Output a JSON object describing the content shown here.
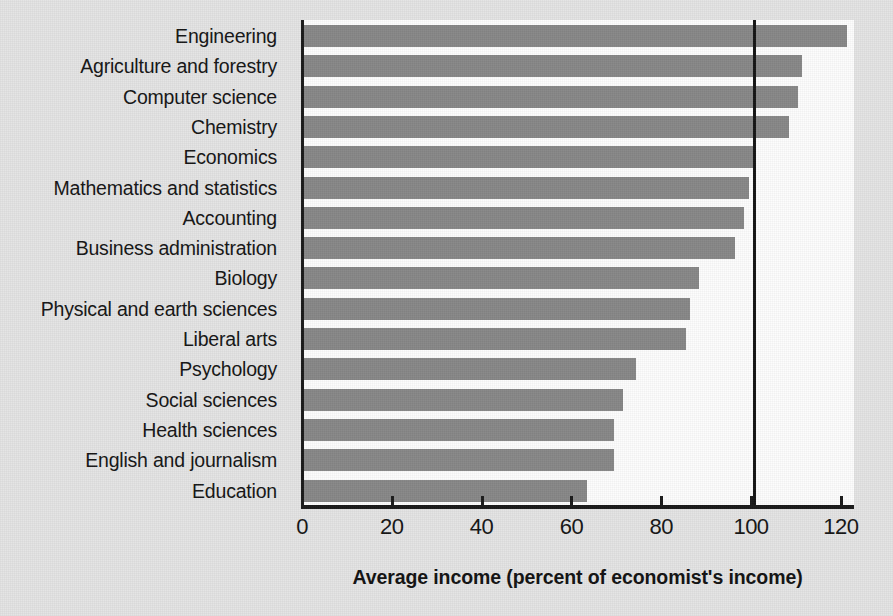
{
  "chart_data": {
    "type": "bar",
    "orientation": "horizontal",
    "title": "",
    "xlabel": "Average income (percent of economist's income)",
    "ylabel": "",
    "xlim": [
      0,
      125
    ],
    "ylim": null,
    "grid": false,
    "legend": null,
    "bar_color": "#878787",
    "reference_line": {
      "value": 100,
      "color": "#141414",
      "label": ""
    },
    "xticks": [
      0,
      20,
      40,
      60,
      80,
      100,
      120
    ],
    "xtick_labels": [
      "0",
      "20",
      "40",
      "60",
      "80",
      "100",
      "120"
    ],
    "categories": [
      "Engineering",
      "Agriculture and forestry",
      "Computer science",
      "Chemistry",
      "Economics",
      "Mathematics and statistics",
      "Accounting",
      "Business administration",
      "Biology",
      "Physical and earth sciences",
      "Liberal arts",
      "Psychology",
      "Social sciences",
      "Health sciences",
      "English and journalism",
      "Education"
    ],
    "values": [
      121,
      111,
      110,
      108,
      100,
      99,
      98,
      96,
      88,
      86,
      85,
      74,
      71,
      69,
      69,
      63
    ]
  }
}
